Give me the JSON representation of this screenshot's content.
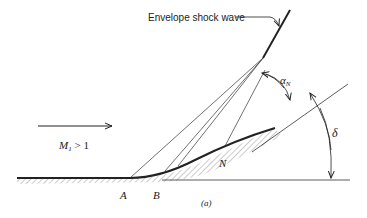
{
  "diagram": {
    "type": "supersonic compression corner with envelope shock",
    "labels": {
      "envelope": "Envelope shock wave",
      "mach_M": "M",
      "mach_sub": "1",
      "mach_rel": " > 1",
      "point_a": "A",
      "point_b": "B",
      "point_n": "N",
      "alpha": "α",
      "alpha_sub": "N",
      "delta": "δ",
      "caption": "(a)"
    },
    "colors": {
      "ink": "#222222",
      "hatch": "#9a9a9a",
      "background": "#ffffff"
    }
  }
}
